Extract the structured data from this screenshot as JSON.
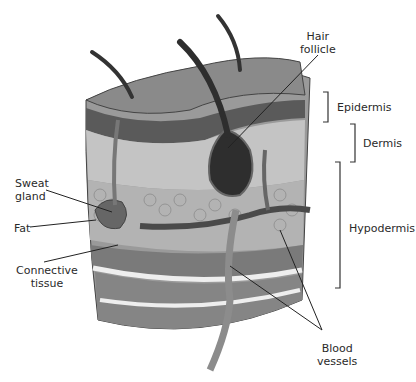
{
  "labels": {
    "hair_follicle": [
      "Hair",
      "follicle"
    ],
    "epidermis": "Epidermis",
    "dermis": "Dermis",
    "hypodermis": "Hypodermis",
    "sweat_gland": [
      "Sweat",
      "gland"
    ],
    "fat": "Fat",
    "connective_tissue": [
      "Connective",
      "tissue"
    ],
    "blood_vessels": [
      "Blood",
      "vessels"
    ]
  },
  "colors": {
    "epidermis_top": "#8a8a8a",
    "dark_layer": "#5a5a5a",
    "light_layer": "#bdbdbd",
    "fat": "#b0b0b0",
    "muscle": "#777777",
    "vessel": "#8c8c8c",
    "follicle": "#2e2e2e",
    "line": "#222222"
  }
}
